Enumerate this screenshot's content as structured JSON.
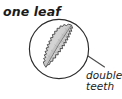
{
  "figure": {
    "background_color": "#ffffff",
    "ink_color": "#1a1a1a",
    "labels": {
      "one_leaf": "one leaf",
      "double": "double",
      "teeth": "teeth"
    },
    "magnifier": {
      "center_x": 59,
      "center_y": 49,
      "radius": 30,
      "stroke_color": "#2b2b2b"
    },
    "leaf": {
      "fill_color": "#cfcfcf",
      "outline_color": "#3a3a3a",
      "midrib_color": "#6e6e6e",
      "margin": "serrate double-toothed"
    },
    "leader_line": {
      "from_x": 70,
      "from_y": 44,
      "to_x": 104,
      "to_y": 67,
      "stroke_color": "#4a4a4a"
    }
  }
}
